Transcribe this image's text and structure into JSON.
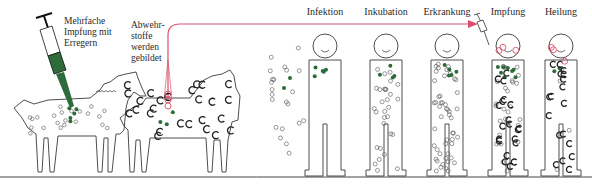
{
  "figure": {
    "labels": {
      "injection": "Mehrfache\nImpfung mit\nErregern",
      "antibodies": "Abwehr-\nstoffe\nwerden\ngebildet"
    },
    "stages": [
      {
        "key": "infection",
        "title": "Infektion"
      },
      {
        "key": "incubation",
        "title": "Inkubation"
      },
      {
        "key": "illness",
        "title": "Erkrankung"
      },
      {
        "key": "vaccination",
        "title": "Impfung"
      },
      {
        "key": "recovery",
        "title": "Heilung"
      }
    ],
    "colors": {
      "outline": "#3a3a3a",
      "pathogen": "#2e6b3a",
      "antibody": "#222222",
      "serum_arrow": "#d9506e",
      "pink_antibody": "#d9506e"
    }
  }
}
